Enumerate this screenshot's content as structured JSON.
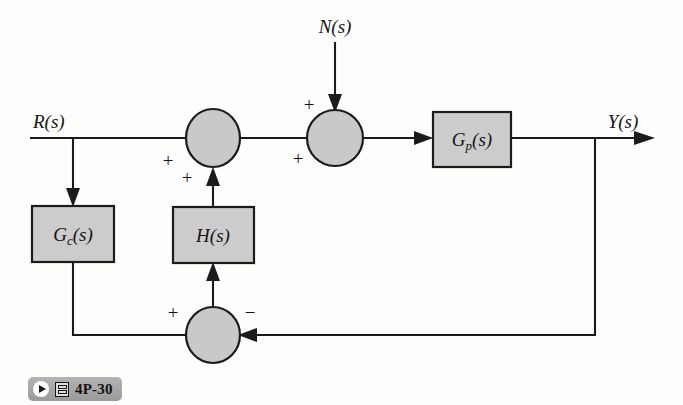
{
  "figure": {
    "kind": "control-system-block-diagram",
    "caption": {
      "label": "4P-30",
      "play_icon": "play-icon",
      "media_icon": "media-grid-icon"
    },
    "colors": {
      "block_fill": "#cccccc",
      "summer_fill": "#c9c9c9",
      "line": "#1b1b1b",
      "background": "#fdfdfc",
      "badge": "#a6a6a6"
    }
  },
  "signals": {
    "input": {
      "base": "R",
      "arg": "(s)",
      "full": "R(s)"
    },
    "disturbance": {
      "base": "N",
      "arg": "(s)",
      "full": "N(s)"
    },
    "output": {
      "base": "Y",
      "arg": "(s)",
      "full": "Y(s)"
    }
  },
  "blocks": [
    {
      "id": "Gc",
      "base": "G",
      "subscript": "c",
      "arg": "(s)",
      "full": "G_c(s)"
    },
    {
      "id": "H",
      "base": "H",
      "subscript": "",
      "arg": "(s)",
      "full": "H(s)"
    },
    {
      "id": "Gp",
      "base": "G",
      "subscript": "p",
      "arg": "(s)",
      "full": "G_p(s)"
    }
  ],
  "summers": [
    {
      "id": "sum1",
      "signs": [
        {
          "name": "sum1-sign-left",
          "symbol": "+"
        },
        {
          "name": "sum1-sign-bottom",
          "symbol": "+"
        }
      ]
    },
    {
      "id": "sum2",
      "signs": [
        {
          "name": "sum2-sign-top",
          "symbol": "+"
        },
        {
          "name": "sum2-sign-left",
          "symbol": "+"
        }
      ]
    },
    {
      "id": "sum3",
      "signs": [
        {
          "name": "sum3-sign-left",
          "symbol": "+"
        },
        {
          "name": "sum3-sign-right",
          "symbol": "−"
        }
      ]
    }
  ]
}
